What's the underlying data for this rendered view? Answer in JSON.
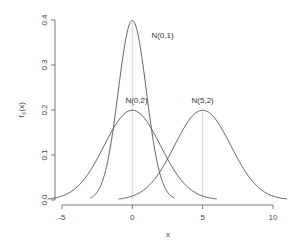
{
  "chart_data": {
    "type": "line",
    "title": "",
    "xlabel": "x",
    "ylabel": "f_X(x)",
    "xlim": [
      -5,
      10
    ],
    "ylim": [
      0,
      0.4
    ],
    "x_ticks": [
      -5,
      0,
      5,
      10
    ],
    "y_ticks": [
      0.0,
      0.1,
      0.2,
      0.3,
      0.4
    ],
    "x_tick_labels": [
      "-5",
      "0",
      "5",
      "10"
    ],
    "y_tick_labels": [
      "0.0",
      "0.1",
      "0.2",
      "0.3",
      "0.4"
    ],
    "grid": false,
    "series": [
      {
        "name": "N(0,1)",
        "mean": 0,
        "sd": 1,
        "x_range": [
          -3,
          3
        ],
        "peak": 0.399
      },
      {
        "name": "N(0,2)",
        "mean": 0,
        "sd": 2,
        "x_range": [
          -6,
          6
        ],
        "peak": 0.199
      },
      {
        "name": "N(5,2)",
        "mean": 5,
        "sd": 2,
        "x_range": [
          -1,
          11
        ],
        "peak": 0.199
      }
    ],
    "annotations": [
      {
        "text": "N(0,1)",
        "x": 1.0,
        "y": 0.36
      },
      {
        "text": "N(0,2)",
        "x": 0.3,
        "y": 0.215
      },
      {
        "text": "N(5,2)",
        "x": 5.0,
        "y": 0.215
      }
    ],
    "reference_lines": [
      {
        "x": 0,
        "from": 0,
        "to": 0.399
      },
      {
        "x": 5,
        "from": 0,
        "to": 0.199
      }
    ]
  },
  "labels": {
    "xlabel": "x",
    "ylabel_main": "f",
    "ylabel_sub": "X",
    "ylabel_arg": "(x)"
  }
}
